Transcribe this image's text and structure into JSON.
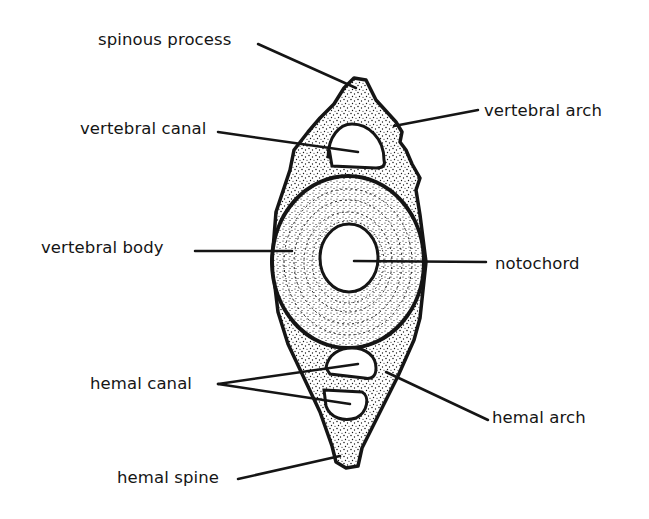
{
  "diagram": {
    "colors": {
      "ink": "#151515",
      "paper": "#ffffff"
    },
    "labels": {
      "spinous_process": "spinous process",
      "vertebral_arch": "vertebral arch",
      "vertebral_canal": "vertebral canal",
      "vertebral_body": "vertebral  body",
      "notochord": "notochord",
      "hemal_canal": "hemal canal",
      "hemal_arch": "hemal arch",
      "hemal_spine": "hemal spine"
    }
  }
}
